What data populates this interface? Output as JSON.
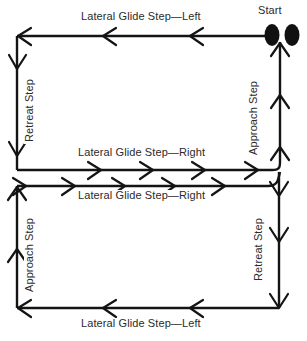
{
  "diagram": {
    "start_label": "Start",
    "line_color": "#141414",
    "text_color": "#2b2b2b",
    "background_color": "#ffffff",
    "labels": {
      "top_horizontal": "Lateral Glide Step—Left",
      "upper_left_vertical": "Retreat Step",
      "upper_right_vertical": "Approach Step",
      "middle_upper_horizontal": "Lateral Glide Step—Right",
      "middle_lower_horizontal": "Lateral Glide Step—Right",
      "lower_left_vertical": "Approach Step",
      "lower_right_vertical": "Retreat Step",
      "bottom_horizontal": "Lateral Glide Step—Left"
    },
    "footprints": {
      "name": "start-footprints",
      "count": 2,
      "shape": "oval"
    },
    "segments": [
      {
        "id": "top",
        "direction": "left",
        "label": "Lateral Glide Step—Left",
        "arrow_count": 3
      },
      {
        "id": "upper-left",
        "direction": "down",
        "label": "Retreat Step",
        "arrow_count": 2
      },
      {
        "id": "middle-upper",
        "direction": "right",
        "label": "Lateral Glide Step—Right",
        "arrow_count": 5
      },
      {
        "id": "middle-lower",
        "direction": "right",
        "label": "Lateral Glide Step—Right",
        "arrow_count": 5
      },
      {
        "id": "upper-right",
        "direction": "up",
        "label": "Approach Step",
        "arrow_count": 3
      },
      {
        "id": "lower-left",
        "direction": "up",
        "label": "Approach Step",
        "arrow_count": 2
      },
      {
        "id": "bottom",
        "direction": "left",
        "label": "Lateral Glide Step—Left",
        "arrow_count": 3
      },
      {
        "id": "lower-right",
        "direction": "down",
        "label": "Retreat Step",
        "arrow_count": 3
      }
    ]
  }
}
